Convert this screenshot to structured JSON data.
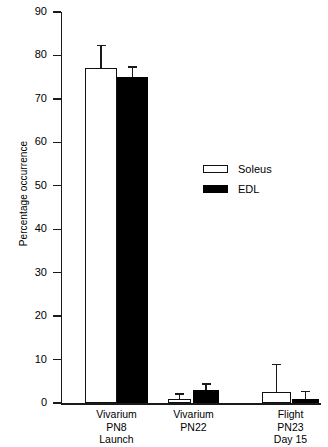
{
  "chart_data": {
    "type": "bar",
    "title": "",
    "xlabel": "",
    "ylabel": "Percentage occurrence",
    "ylim": [
      0,
      90
    ],
    "yticks": [
      0,
      10,
      20,
      30,
      40,
      50,
      60,
      70,
      80,
      90
    ],
    "grid": false,
    "legend_position": "center-right",
    "categories": [
      "Vivarium\nPN8\nLaunch",
      "Vivarium\nPN22",
      "Flight\nPN23\nDay 15"
    ],
    "series": [
      {
        "name": "Soleus",
        "color": "#ffffff",
        "edge_color": "#111111",
        "values": [
          77,
          1,
          2.5
        ],
        "errors": [
          5.5,
          1.2,
          6.5
        ]
      },
      {
        "name": "EDL",
        "color": "#000000",
        "edge_color": "#000000",
        "values": [
          75,
          3,
          1
        ],
        "errors": [
          2.5,
          1.5,
          1.8
        ]
      }
    ]
  },
  "axis": {
    "y_title": "Percentage occurrence",
    "tick_labels": [
      "90",
      "80",
      "70",
      "60",
      "50",
      "40",
      "30",
      "20",
      "10",
      "0"
    ]
  },
  "legend": {
    "items": [
      {
        "label": "Soleus",
        "style": "soleus"
      },
      {
        "label": "EDL",
        "style": "edl"
      }
    ]
  },
  "groups": [
    {
      "label": "Vivarium\nPN8\nLaunch"
    },
    {
      "label": "Vivarium\nPN22"
    },
    {
      "label": "Flight\nPN23\nDay 15"
    }
  ]
}
